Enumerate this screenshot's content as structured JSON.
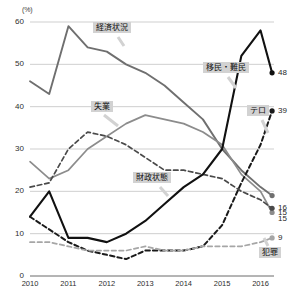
{
  "chart_data": {
    "type": "line",
    "title": "",
    "xlabel": "",
    "ylabel": "(%)",
    "unit": "(%)",
    "x": [
      2010,
      2011,
      2012,
      2013,
      2014,
      2015,
      2016
    ],
    "xlim": [
      2010,
      2016.35
    ],
    "ylim": [
      0,
      60
    ],
    "yticks": [
      0,
      10,
      20,
      30,
      40,
      50,
      60
    ],
    "xticks": [
      "2010",
      "2011",
      "2012",
      "2013",
      "2014",
      "2015",
      "2016"
    ],
    "grid": true,
    "legend_position": "inline-annotations",
    "series": [
      {
        "name": "経済状況",
        "label": "経済状況",
        "style": "solid",
        "color": "#6f6f6f",
        "width": 1.9,
        "end_value": 15,
        "x": [
          2010,
          2010.5,
          2011,
          2011.5,
          2012,
          2012.5,
          2013,
          2013.5,
          2014,
          2014.5,
          2015,
          2015.5,
          2016,
          2016.3
        ],
        "values": [
          46,
          43,
          59,
          54,
          53,
          50,
          48,
          45,
          41,
          37,
          30,
          25,
          21,
          19
        ]
      },
      {
        "name": "失業",
        "label": "失業",
        "style": "solid",
        "color": "#8c8c8c",
        "width": 1.7,
        "end_value": 15,
        "x": [
          2010,
          2010.5,
          2011,
          2011.5,
          2012,
          2012.5,
          2013,
          2013.5,
          2014,
          2014.5,
          2015,
          2015.5,
          2016,
          2016.3
        ],
        "values": [
          27,
          23,
          25,
          30,
          33,
          36,
          38,
          37,
          36,
          34,
          31,
          24,
          20,
          15
        ]
      },
      {
        "name": "財政状態",
        "label": "財政状態",
        "style": "dashed",
        "color": "#4a4a4a",
        "width": 1.7,
        "end_value": 16,
        "x": [
          2010,
          2010.5,
          2011,
          2011.5,
          2012,
          2012.5,
          2013,
          2013.5,
          2014,
          2014.5,
          2015,
          2015.5,
          2016,
          2016.3
        ],
        "values": [
          21,
          22,
          30,
          34,
          33,
          31,
          28,
          25,
          25,
          24,
          23,
          20,
          18,
          16
        ]
      },
      {
        "name": "移民・難民",
        "label": "移民・難民",
        "style": "solid",
        "color": "#111111",
        "width": 2.1,
        "end_value": 48,
        "x": [
          2010,
          2010.5,
          2011,
          2011.5,
          2012,
          2012.5,
          2013,
          2013.5,
          2014,
          2014.5,
          2015,
          2015.5,
          2016,
          2016.3
        ],
        "values": [
          14,
          20,
          9,
          9,
          8,
          10,
          13,
          17,
          21,
          24,
          30,
          52,
          58,
          48
        ]
      },
      {
        "name": "テロ",
        "label": "テロ",
        "style": "dashed",
        "color": "#1a1a1a",
        "width": 2.0,
        "end_value": 39,
        "x": [
          2010,
          2010.5,
          2011,
          2011.5,
          2012,
          2012.5,
          2013,
          2013.5,
          2014,
          2014.5,
          2015,
          2015.5,
          2016,
          2016.3
        ],
        "values": [
          14,
          11,
          8,
          6,
          5,
          4,
          6,
          6,
          6,
          7,
          12,
          22,
          31,
          39
        ]
      },
      {
        "name": "犯罪",
        "label": "犯罪",
        "style": "dashed",
        "color": "#a6a6a6",
        "width": 1.7,
        "end_value": 9,
        "x": [
          2010,
          2010.5,
          2011,
          2011.5,
          2012,
          2012.5,
          2013,
          2013.5,
          2014,
          2014.5,
          2015,
          2015.5,
          2016,
          2016.3
        ],
        "values": [
          8,
          8,
          7,
          6,
          6,
          6,
          7,
          6,
          6,
          7,
          7,
          7,
          8,
          9
        ]
      }
    ],
    "end_labels": [
      {
        "text": "48",
        "value": 48
      },
      {
        "text": "39",
        "value": 39
      },
      {
        "text": "19",
        "value": 19
      },
      {
        "text": "16",
        "value": 16
      },
      {
        "text": "15",
        "value": 15
      },
      {
        "text": "9",
        "value": 9
      }
    ],
    "annotations": [
      {
        "text": "経済状況"
      },
      {
        "text": "移民・難民"
      },
      {
        "text": "失業"
      },
      {
        "text": "テロ"
      },
      {
        "text": "財政状態"
      },
      {
        "text": "犯罪"
      }
    ]
  }
}
